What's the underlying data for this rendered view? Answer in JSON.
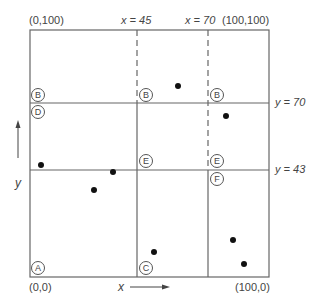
{
  "diagram": {
    "corners": {
      "top_left": "(0,100)",
      "top_right": "(100,100)",
      "bottom_left": "(0,0)",
      "bottom_right": "(100,0)"
    },
    "dividers": {
      "x1": "x = 45",
      "x2": "x = 70",
      "y1": "y = 70",
      "y2": "y = 43"
    },
    "axes": {
      "x_label": "x",
      "y_label": "y"
    },
    "regions": [
      {
        "id": "B",
        "label": "B",
        "pos": "top-left cell"
      },
      {
        "id": "B2",
        "label": "B",
        "pos": "top-middle cell"
      },
      {
        "id": "B3",
        "label": "B",
        "pos": "top-right cell"
      },
      {
        "id": "D",
        "label": "D",
        "pos": "middle-left cell"
      },
      {
        "id": "E",
        "label": "E",
        "pos": "middle-middle cell"
      },
      {
        "id": "E2",
        "label": "E",
        "pos": "middle-right cell"
      },
      {
        "id": "F",
        "label": "F",
        "pos": "lower-right cell"
      },
      {
        "id": "A",
        "label": "A",
        "pos": "bottom-left cell"
      },
      {
        "id": "C",
        "label": "C",
        "pos": "bottom-middle cell"
      }
    ],
    "points": [
      {
        "x": 60,
        "y": 77
      },
      {
        "x": 78,
        "y": 64
      },
      {
        "x": 4,
        "y": 44
      },
      {
        "x": 34,
        "y": 39
      },
      {
        "x": 25,
        "y": 33
      },
      {
        "x": 51,
        "y": 11
      },
      {
        "x": 85,
        "y": 15
      },
      {
        "x": 90,
        "y": 6
      }
    ]
  }
}
